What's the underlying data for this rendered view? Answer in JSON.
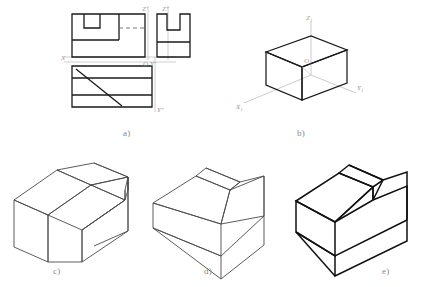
{
  "figure": {
    "background_color": "#ffffff",
    "line_color": "#1a1a1a",
    "thin_line_color": "#444444",
    "axis_line_color": "#9a9a9a",
    "label_color": "#8a8a8a",
    "caption_color": "#8a8a8a"
  },
  "captions": {
    "a": "a)",
    "b": "b)",
    "c": "c)",
    "d": "d)",
    "e": "e)"
  },
  "panel_a": {
    "title": "orthographic three-view projection",
    "axis_labels": {
      "z_prime": "Z'",
      "z_double_prime": "Z\"",
      "x": "X",
      "y_prime": "Y'",
      "y_double_prime": "Y\"",
      "origin": "O"
    },
    "views": [
      {
        "name": "front-view",
        "description": "rectangle with rectangular notch at upper left and dashed hidden line"
      },
      {
        "name": "side-view",
        "description": "U-shaped profile with horizontal division line"
      },
      {
        "name": "top-view",
        "description": "rectangle with two horizontal division lines and a diagonal line"
      }
    ]
  },
  "panel_b": {
    "title": "isometric axonometric axes with bounding box",
    "axis_labels": {
      "z1": "Z",
      "z1_sub": "1",
      "x1": "X",
      "x1_sub": "1",
      "y1": "Y",
      "y1_sub": "1",
      "o1": "O",
      "o1_sub": "1"
    }
  },
  "panel_c": {
    "title": "isometric solid with rectangular through slot",
    "line_weight": "thin"
  },
  "panel_d": {
    "title": "isometric solid with angled chamfer cut",
    "line_weight": "thin"
  },
  "panel_e": {
    "title": "isometric solid with slot and chamfer, bold outline",
    "line_weight": "bold"
  }
}
